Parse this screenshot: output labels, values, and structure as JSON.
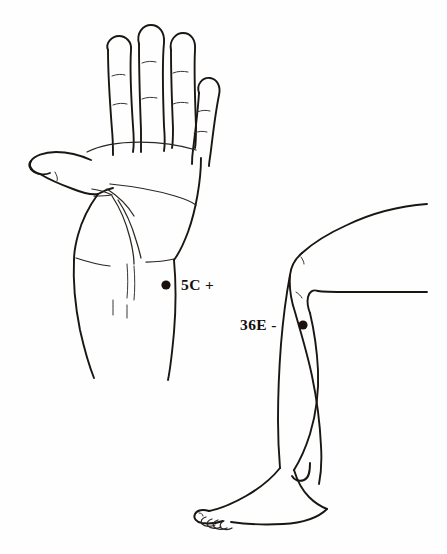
{
  "figure": {
    "type": "acupuncture-point-line-drawing",
    "background_color": "#fefefe",
    "ink_color": "#1a1713",
    "panels": [
      {
        "name": "left-hand-palm",
        "description": "open left hand, palm facing viewer, with forearm"
      },
      {
        "name": "right-leg",
        "description": "bent leg seen from the side with knee, shin, ankle and foot"
      }
    ]
  },
  "annotations": {
    "point_color": "#1a100c",
    "items": [
      {
        "id": "point-5c",
        "code": "5C",
        "polarity": "+",
        "label": "5C +",
        "dot": {
          "cx": 166,
          "cy": 285,
          "r": 4.6
        },
        "panel": "left-hand-palm"
      },
      {
        "id": "point-36e",
        "code": "36E",
        "polarity": "-",
        "label": "36E -",
        "dot": {
          "cx": 303,
          "cy": 325,
          "r": 4.6
        },
        "panel": "right-leg"
      }
    ]
  }
}
